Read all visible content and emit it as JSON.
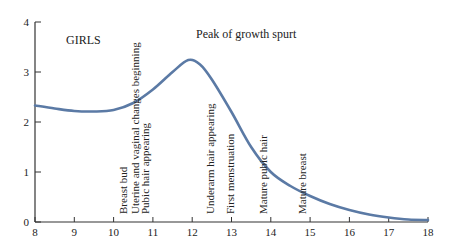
{
  "chart_data": {
    "type": "line",
    "title": "",
    "panel_label": "GIRLS",
    "peak_annotation": "Peak of growth spurt",
    "xlabel": "",
    "ylabel": "",
    "xlim": [
      8,
      18
    ],
    "ylim": [
      0,
      4
    ],
    "x_ticks": [
      8,
      9,
      10,
      11,
      12,
      13,
      14,
      15,
      16,
      17,
      18
    ],
    "y_ticks": [
      0,
      1,
      2,
      3,
      4
    ],
    "grid": false,
    "legend": null,
    "series": [
      {
        "name": "Growth rate (girls)",
        "color": "#5b7aa5",
        "x": [
          8,
          8.5,
          9,
          9.5,
          10,
          10.5,
          11,
          11.5,
          11.9,
          12.2,
          12.5,
          13,
          13.5,
          14,
          14.5,
          15,
          15.5,
          16,
          16.5,
          17,
          17.5,
          18
        ],
        "y": [
          2.33,
          2.27,
          2.22,
          2.21,
          2.24,
          2.38,
          2.65,
          3.0,
          3.24,
          3.15,
          2.85,
          2.2,
          1.5,
          1.0,
          0.72,
          0.52,
          0.36,
          0.24,
          0.15,
          0.09,
          0.05,
          0.04
        ]
      }
    ],
    "annotations": [
      {
        "text": "Breast bud",
        "x": 10.25
      },
      {
        "text": "Uterine and vaginal changes beginning",
        "x": 10.55
      },
      {
        "text": "Pubic hair appearing",
        "x": 10.8
      },
      {
        "text": "Underarm hair appearing",
        "x": 12.45
      },
      {
        "text": "First menstruation",
        "x": 12.95
      },
      {
        "text": "Mature pubic hair",
        "x": 13.8
      },
      {
        "text": "Mature breast",
        "x": 14.8
      }
    ]
  }
}
